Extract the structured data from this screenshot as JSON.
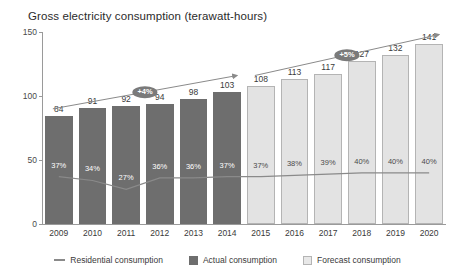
{
  "chart_data": {
    "type": "bar",
    "title": "Gross electricity consumption (terawatt-hours)",
    "xlabel": "",
    "ylabel": "",
    "ylim": [
      0,
      150
    ],
    "yticks": [
      0,
      50,
      100,
      150
    ],
    "grid": false,
    "legend_position": "bottom-center",
    "categories": [
      "2009",
      "2010",
      "2011",
      "2012",
      "2013",
      "2014",
      "2015",
      "2016",
      "2017",
      "2018",
      "2019",
      "2020"
    ],
    "series": [
      {
        "name": "Actual consumption",
        "type": "bar",
        "color": "#6e6e6e",
        "values": [
          84,
          91,
          92,
          94,
          98,
          103,
          null,
          null,
          null,
          null,
          null,
          null
        ]
      },
      {
        "name": "Forecast consumption",
        "type": "bar",
        "color": "#e3e3e3",
        "values": [
          null,
          null,
          null,
          null,
          null,
          null,
          108,
          113,
          117,
          127,
          132,
          141
        ]
      },
      {
        "name": "Residential consumption",
        "type": "line",
        "color": "#8a8a8a",
        "unit": "%",
        "labels": [
          "37%",
          "34%",
          "27%",
          "36%",
          "36%",
          "37%",
          "37%",
          "38%",
          "39%",
          "40%",
          "40%",
          "40%"
        ],
        "values": [
          37,
          34,
          27,
          36,
          36,
          37,
          37,
          38,
          39,
          40,
          40,
          40
        ]
      }
    ],
    "annotations": [
      {
        "name": "actual-growth-arrow",
        "label": "+4%",
        "from_category": "2009",
        "to_category": "2014"
      },
      {
        "name": "forecast-growth-arrow",
        "label": "+5%",
        "from_category": "2015",
        "to_category": "2020"
      }
    ],
    "legend": [
      {
        "name": "Residential consumption",
        "marker": "line",
        "color": "#8a8a8a"
      },
      {
        "name": "Actual consumption",
        "marker": "box",
        "color": "#6e6e6e"
      },
      {
        "name": "Forecast consumption",
        "marker": "box",
        "color": "#e8e8e8"
      }
    ]
  }
}
